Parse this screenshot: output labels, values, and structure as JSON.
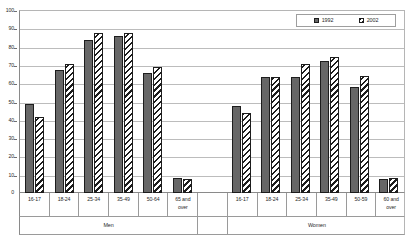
{
  "chart_data": {
    "type": "bar",
    "title": "",
    "xlabel": "",
    "ylabel": "",
    "ylim": [
      0,
      100
    ],
    "ytick_step": 10,
    "yticks": [
      0,
      10,
      20,
      30,
      40,
      50,
      60,
      70,
      80,
      90,
      100
    ],
    "grid": true,
    "legend_position": "top-right",
    "legend": [
      "1992",
      "2002"
    ],
    "groups": [
      {
        "name": "Men",
        "categories": [
          "16-17",
          "18-24",
          "25-34",
          "35-49",
          "50-64",
          "65 and\nover"
        ],
        "series": [
          {
            "name": "1992",
            "values": [
              49,
              67.5,
              84,
              86.5,
              66,
              8.5
            ]
          },
          {
            "name": "2002",
            "values": [
              41.5,
              71,
              88,
              88,
              69.5,
              7.5
            ]
          }
        ]
      },
      {
        "name": "Women",
        "categories": [
          "16-17",
          "18-24",
          "25-34",
          "35-49",
          "50-59",
          "60 and\nover"
        ],
        "series": [
          {
            "name": "1992",
            "values": [
              48,
              63.5,
              63.5,
              72.5,
              58.5,
              7.5
            ]
          },
          {
            "name": "2002",
            "values": [
              44,
              64,
              71,
              75,
              64.5,
              8.5
            ]
          }
        ]
      }
    ],
    "colors": {
      "series_1992": "#676767",
      "series_2002": "#ffffff",
      "bar_outline": "#1d1d1d",
      "gridline": "#bcbcbc",
      "axis": "#8a8a8a",
      "text": "#2a2a2a",
      "background": "#ffffff"
    }
  },
  "axis": {
    "y_tick_labels": [
      "100",
      "90",
      "80",
      "70",
      "60",
      "50",
      "40",
      "30",
      "20",
      "10",
      "0"
    ]
  },
  "legend": {
    "items": [
      {
        "label": "1992",
        "swatch": "solid-gray-swatch"
      },
      {
        "label": "2002",
        "swatch": "hatched-white-swatch"
      }
    ]
  },
  "categories_row": [
    "16-17",
    "18-24",
    "25-34",
    "35-49",
    "50-64",
    "65 and\nover",
    "",
    "16-17",
    "18-24",
    "25-34",
    "35-49",
    "50-59",
    "60 and\nover"
  ],
  "group_row": [
    "Men",
    "",
    "Women"
  ]
}
